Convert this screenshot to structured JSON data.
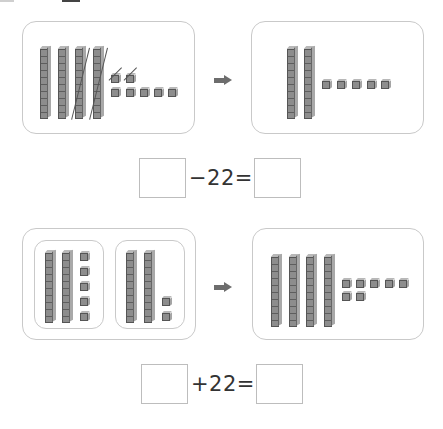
{
  "problems": [
    {
      "id": 1,
      "operation": "subtract",
      "before": {
        "tens_rods": 4,
        "ones_units": 7,
        "crossed_rods": 2,
        "crossed_units": 2
      },
      "after": {
        "tens_rods": 2,
        "ones_units": 5
      },
      "arrow_icon": "right-arrow",
      "equation": {
        "blank_left": "",
        "operator_text": "−22=",
        "blank_right": ""
      }
    },
    {
      "id": 2,
      "operation": "add",
      "before": {
        "group_a": {
          "tens_rods": 2,
          "ones_units": 5
        },
        "group_b": {
          "tens_rods": 2,
          "ones_units": 2
        }
      },
      "after": {
        "tens_rods": 4,
        "ones_units": 7
      },
      "arrow_icon": "right-arrow",
      "equation": {
        "blank_left": "",
        "operator_text": "+22=",
        "blank_right": ""
      }
    }
  ],
  "colors": {
    "block": "#8d8d8d",
    "border": "#c9c9c9",
    "arrow": "#6d6d6d",
    "text": "#333333"
  }
}
